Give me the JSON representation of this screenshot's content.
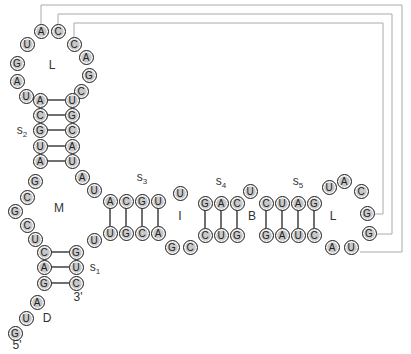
{
  "colors": {
    "nucleotide_fill": "#c8c8c8",
    "nucleotide_stroke": "#222222",
    "connector": "#aaaaaa",
    "bond": "#222222"
  },
  "nucleotides": [
    {
      "id": "n1",
      "base": "G",
      "x": 15,
      "y": 333
    },
    {
      "id": "n2",
      "base": "U",
      "x": 26,
      "y": 318
    },
    {
      "id": "n3",
      "base": "A",
      "x": 37,
      "y": 302
    },
    {
      "id": "n4",
      "base": "G",
      "x": 44,
      "y": 283
    },
    {
      "id": "n5",
      "base": "A",
      "x": 44,
      "y": 267
    },
    {
      "id": "n6",
      "base": "C",
      "x": 44,
      "y": 252
    },
    {
      "id": "n7",
      "base": "U",
      "x": 35,
      "y": 239
    },
    {
      "id": "n8",
      "base": "C",
      "x": 27,
      "y": 225
    },
    {
      "id": "n9",
      "base": "G",
      "x": 15,
      "y": 211
    },
    {
      "id": "n10",
      "base": "C",
      "x": 27,
      "y": 197
    },
    {
      "id": "n11",
      "base": "G",
      "x": 35,
      "y": 181
    },
    {
      "id": "n12",
      "base": "A",
      "x": 40,
      "y": 161
    },
    {
      "id": "n13",
      "base": "U",
      "x": 40,
      "y": 146
    },
    {
      "id": "n14",
      "base": "G",
      "x": 40,
      "y": 130
    },
    {
      "id": "n15",
      "base": "C",
      "x": 40,
      "y": 115
    },
    {
      "id": "n16",
      "base": "A",
      "x": 40,
      "y": 100
    },
    {
      "id": "n17",
      "base": "U",
      "x": 26,
      "y": 96
    },
    {
      "id": "n18",
      "base": "A",
      "x": 17,
      "y": 81
    },
    {
      "id": "n19",
      "base": "G",
      "x": 17,
      "y": 63
    },
    {
      "id": "n20",
      "base": "U",
      "x": 27,
      "y": 44
    },
    {
      "id": "n21",
      "base": "A",
      "x": 41,
      "y": 31
    },
    {
      "id": "n22",
      "base": "C",
      "x": 58,
      "y": 31
    },
    {
      "id": "n23",
      "base": "C",
      "x": 74,
      "y": 44
    },
    {
      "id": "n24",
      "base": "A",
      "x": 86,
      "y": 57
    },
    {
      "id": "n25",
      "base": "G",
      "x": 89,
      "y": 75
    },
    {
      "id": "n26",
      "base": "C",
      "x": 81,
      "y": 91
    },
    {
      "id": "n27",
      "base": "U",
      "x": 72,
      "y": 100
    },
    {
      "id": "n28",
      "base": "G",
      "x": 72,
      "y": 115
    },
    {
      "id": "n29",
      "base": "C",
      "x": 72,
      "y": 130
    },
    {
      "id": "n30",
      "base": "A",
      "x": 72,
      "y": 146
    },
    {
      "id": "n31",
      "base": "U",
      "x": 72,
      "y": 161
    },
    {
      "id": "n32",
      "base": "A",
      "x": 82,
      "y": 177
    },
    {
      "id": "n33",
      "base": "U",
      "x": 94,
      "y": 190
    },
    {
      "id": "n34",
      "base": "A",
      "x": 110,
      "y": 201
    },
    {
      "id": "n35",
      "base": "C",
      "x": 126,
      "y": 201
    },
    {
      "id": "n36",
      "base": "G",
      "x": 142,
      "y": 201
    },
    {
      "id": "n37",
      "base": "U",
      "x": 158,
      "y": 201
    },
    {
      "id": "n38",
      "base": "U",
      "x": 180,
      "y": 193
    },
    {
      "id": "n39",
      "base": "G",
      "x": 205,
      "y": 203
    },
    {
      "id": "n40",
      "base": "A",
      "x": 221,
      "y": 203
    },
    {
      "id": "n41",
      "base": "C",
      "x": 237,
      "y": 203
    },
    {
      "id": "n42",
      "base": "U",
      "x": 250,
      "y": 191
    },
    {
      "id": "n43",
      "base": "C",
      "x": 266,
      "y": 203
    },
    {
      "id": "n44",
      "base": "U",
      "x": 282,
      "y": 203
    },
    {
      "id": "n45",
      "base": "A",
      "x": 298,
      "y": 203
    },
    {
      "id": "n46",
      "base": "G",
      "x": 314,
      "y": 203
    },
    {
      "id": "n47",
      "base": "U",
      "x": 329,
      "y": 187
    },
    {
      "id": "n48",
      "base": "A",
      "x": 344,
      "y": 181
    },
    {
      "id": "n49",
      "base": "C",
      "x": 361,
      "y": 191
    },
    {
      "id": "n50",
      "base": "G",
      "x": 367,
      "y": 213
    },
    {
      "id": "n51",
      "base": "G",
      "x": 369,
      "y": 233
    },
    {
      "id": "n52",
      "base": "U",
      "x": 351,
      "y": 247
    },
    {
      "id": "n53",
      "base": "A",
      "x": 332,
      "y": 247
    },
    {
      "id": "n54",
      "base": "C",
      "x": 314,
      "y": 235
    },
    {
      "id": "n55",
      "base": "U",
      "x": 298,
      "y": 235
    },
    {
      "id": "n56",
      "base": "A",
      "x": 282,
      "y": 235
    },
    {
      "id": "n57",
      "base": "G",
      "x": 266,
      "y": 235
    },
    {
      "id": "n58",
      "base": "G",
      "x": 237,
      "y": 235
    },
    {
      "id": "n59",
      "base": "U",
      "x": 221,
      "y": 235
    },
    {
      "id": "n60",
      "base": "C",
      "x": 205,
      "y": 235
    },
    {
      "id": "n61",
      "base": "C",
      "x": 190,
      "y": 247
    },
    {
      "id": "n62",
      "base": "G",
      "x": 172,
      "y": 247
    },
    {
      "id": "n63",
      "base": "A",
      "x": 158,
      "y": 233
    },
    {
      "id": "n64",
      "base": "C",
      "x": 142,
      "y": 233
    },
    {
      "id": "n65",
      "base": "G",
      "x": 126,
      "y": 233
    },
    {
      "id": "n66",
      "base": "U",
      "x": 110,
      "y": 233
    },
    {
      "id": "n67",
      "base": "U",
      "x": 94,
      "y": 240
    },
    {
      "id": "n68",
      "base": "G",
      "x": 76,
      "y": 252
    },
    {
      "id": "n69",
      "base": "U",
      "x": 76,
      "y": 267
    },
    {
      "id": "n70",
      "base": "C",
      "x": 76,
      "y": 283
    }
  ],
  "bonds": [
    {
      "a": "n4",
      "b": "n70",
      "dir": "h"
    },
    {
      "a": "n5",
      "b": "n69",
      "dir": "h"
    },
    {
      "a": "n6",
      "b": "n68",
      "dir": "h"
    },
    {
      "a": "n12",
      "b": "n31",
      "dir": "h"
    },
    {
      "a": "n13",
      "b": "n30",
      "dir": "h"
    },
    {
      "a": "n14",
      "b": "n29",
      "dir": "h"
    },
    {
      "a": "n15",
      "b": "n28",
      "dir": "h"
    },
    {
      "a": "n16",
      "b": "n27",
      "dir": "h"
    },
    {
      "a": "n34",
      "b": "n66",
      "dir": "v"
    },
    {
      "a": "n35",
      "b": "n65",
      "dir": "v"
    },
    {
      "a": "n36",
      "b": "n64",
      "dir": "v"
    },
    {
      "a": "n37",
      "b": "n63",
      "dir": "v"
    },
    {
      "a": "n39",
      "b": "n60",
      "dir": "v"
    },
    {
      "a": "n40",
      "b": "n59",
      "dir": "v"
    },
    {
      "a": "n41",
      "b": "n58",
      "dir": "v"
    },
    {
      "a": "n43",
      "b": "n57",
      "dir": "v"
    },
    {
      "a": "n44",
      "b": "n56",
      "dir": "v"
    },
    {
      "a": "n45",
      "b": "n55",
      "dir": "v"
    },
    {
      "a": "n46",
      "b": "n54",
      "dir": "v"
    }
  ],
  "pseudoknot_connectors": [
    {
      "from": "n21",
      "to": "n52",
      "top_y": 5,
      "right_x": 402,
      "end_y": 252,
      "end_x": 360
    },
    {
      "from": "n22",
      "to": "n51",
      "top_y": 14,
      "right_x": 392,
      "end_y": 234,
      "end_x": 377
    },
    {
      "from": "n23",
      "to": "n50",
      "top_y": 23,
      "right_x": 383,
      "end_y": 214,
      "end_x": 375
    }
  ],
  "labels": [
    {
      "id": "loop-top",
      "text": "L",
      "x": 52,
      "y": 65
    },
    {
      "id": "stem-2",
      "text": "s",
      "sub": "2",
      "x": 22,
      "y": 131
    },
    {
      "id": "multiloop",
      "text": "M",
      "x": 59,
      "y": 208
    },
    {
      "id": "stem-3",
      "text": "s",
      "sub": "3",
      "x": 142,
      "y": 178
    },
    {
      "id": "internal-loop",
      "text": "I",
      "x": 180,
      "y": 216
    },
    {
      "id": "stem-4",
      "text": "s",
      "sub": "4",
      "x": 221,
      "y": 182
    },
    {
      "id": "bulge",
      "text": "B",
      "x": 252,
      "y": 216
    },
    {
      "id": "stem-5",
      "text": "s",
      "sub": "5",
      "x": 298,
      "y": 182
    },
    {
      "id": "loop-right",
      "text": "L",
      "x": 333,
      "y": 216
    },
    {
      "id": "stem-1",
      "text": "s",
      "sub": "1",
      "x": 95,
      "y": 268
    },
    {
      "id": "three-prime",
      "text": "3'",
      "x": 78,
      "y": 297
    },
    {
      "id": "dangling-end",
      "text": "D",
      "x": 47,
      "y": 318
    },
    {
      "id": "five-prime",
      "text": "5'",
      "x": 17,
      "y": 345
    }
  ]
}
